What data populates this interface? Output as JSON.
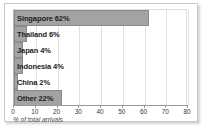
{
  "chart_data": {
    "type": "bar",
    "orientation": "horizontal",
    "title": "",
    "xlabel": "% of total arrivals",
    "ylabel": "",
    "xlim": [
      0,
      80
    ],
    "xticks": [
      0,
      10,
      20,
      30,
      40,
      50,
      60,
      70,
      80
    ],
    "grid": true,
    "legend": false,
    "categories": [
      "Singapore",
      "Thailand",
      "Japan",
      "Indonesia",
      "China",
      "Other"
    ],
    "values": [
      62,
      6,
      4,
      4,
      2,
      22
    ],
    "bar_labels": [
      "Singapore 62%",
      "Thailand 6%",
      "Japan 4%",
      "Indonesia 4%",
      "China 2%",
      "Other 22%"
    ],
    "colors": {
      "bar_fill": "#a3a3a3",
      "bar_stroke": "#8a8a8a",
      "gridline": "#e2e2e2",
      "axis": "#9a9a9a",
      "text": "#1c1c1c",
      "background": "#ffffff",
      "frame_border": "#c9c9c9"
    }
  }
}
